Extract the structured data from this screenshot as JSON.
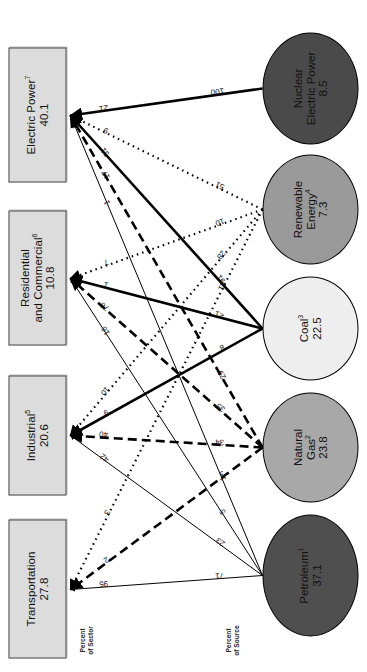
{
  "figure": {
    "units_note": "(Quadrillion Btu)",
    "source_axis_caption": "Percent\nof Source",
    "source_axis_caption_line1": "Percent",
    "source_axis_caption_line2": "of Source",
    "sector_axis_caption_line1": "Percent",
    "sector_axis_caption_line2": "of Sector"
  },
  "sources": [
    {
      "id": "petroleum",
      "name": "Petroleum",
      "footnote": "1",
      "value": "37.1",
      "fill": "#4f4f4f",
      "text_color": "#111111"
    },
    {
      "id": "natural-gas",
      "name": "Natural\nGas",
      "line1": "Natural",
      "line2": "Gas",
      "footnote": "2",
      "value": "23.8",
      "fill": "#a8a8a8",
      "text_color": "#111111"
    },
    {
      "id": "coal",
      "name": "Coal",
      "footnote": "3",
      "value": "22.5",
      "fill": "#eeeeee",
      "text_color": "#111111"
    },
    {
      "id": "renewable",
      "name": "Renewable\nEnergy",
      "line1": "Renewable",
      "line2": "Energy",
      "footnote": "4",
      "value": "7.3",
      "fill": "#9a9a9a",
      "text_color": "#111111"
    },
    {
      "id": "nuclear",
      "name": "Nuclear\nElectric Power",
      "line1": "Nuclear",
      "line2": "Electric Power",
      "footnote": "",
      "value": "8.5",
      "fill": "#4a4a4a",
      "text_color": "#111111"
    }
  ],
  "sectors": [
    {
      "id": "transportation",
      "name": "Transportation",
      "line1": "Transportation",
      "line2": "",
      "footnote": "",
      "value": "27.8"
    },
    {
      "id": "industrial",
      "name": "Industrial",
      "line1": "Industrial",
      "line2": "",
      "footnote": "5",
      "value": "20.6"
    },
    {
      "id": "residential",
      "name": "Residential and Commercial",
      "line1": "Residential",
      "line2": "and Commercial",
      "footnote": "6",
      "value": "10.8"
    },
    {
      "id": "electric-power",
      "name": "Electric Power",
      "line1": "Electric Power",
      "line2": "",
      "footnote": "7",
      "value": "40.1"
    }
  ],
  "chart_data": {
    "type": "diagram",
    "subtitle": "(Quadrillion Btu)",
    "source_totals": {
      "petroleum": 37.1,
      "natural-gas": 23.8,
      "coal": 22.5,
      "renewable": 7.3,
      "nuclear": 8.5
    },
    "sector_totals": {
      "transportation": 27.8,
      "industrial": 20.6,
      "residential": 10.8,
      "electric-power": 40.1
    },
    "flows": [
      {
        "source": "petroleum",
        "sector": "transportation",
        "percent_of_source": "71",
        "percent_of_sector": "95",
        "style": "solid-thin"
      },
      {
        "source": "petroleum",
        "sector": "industrial",
        "percent_of_source": "23",
        "percent_of_sector": "42",
        "style": "solid-thin"
      },
      {
        "source": "petroleum",
        "sector": "residential",
        "percent_of_source": "5",
        "percent_of_sector": "16",
        "style": "solid-thin"
      },
      {
        "source": "petroleum",
        "sector": "electric-power",
        "percent_of_source": "1",
        "percent_of_sector": "1",
        "style": "solid-thin"
      },
      {
        "source": "natural-gas",
        "sector": "transportation",
        "percent_of_source": "3",
        "percent_of_sector": "2",
        "style": "dashed"
      },
      {
        "source": "natural-gas",
        "sector": "industrial",
        "percent_of_source": "34",
        "percent_of_sector": "40",
        "style": "dashed"
      },
      {
        "source": "natural-gas",
        "sector": "residential",
        "percent_of_source": "35",
        "percent_of_sector": "76",
        "style": "dashed"
      },
      {
        "source": "natural-gas",
        "sector": "electric-power",
        "percent_of_source": "29",
        "percent_of_sector": "17",
        "style": "dashed"
      },
      {
        "source": "coal",
        "sector": "industrial",
        "percent_of_source": "8",
        "percent_of_sector": "9",
        "style": "solid-thick"
      },
      {
        "source": "coal",
        "sector": "residential",
        "percent_of_source": "<1",
        "percent_of_sector": "1",
        "style": "solid-thick"
      },
      {
        "source": "coal",
        "sector": "electric-power",
        "percent_of_source": "91",
        "percent_of_sector": "51",
        "style": "solid-thick"
      },
      {
        "source": "renewable",
        "sector": "transportation",
        "percent_of_source": "11",
        "percent_of_sector": "3",
        "style": "dotted"
      },
      {
        "source": "renewable",
        "sector": "industrial",
        "percent_of_source": "28",
        "percent_of_sector": "10",
        "style": "dotted"
      },
      {
        "source": "renewable",
        "sector": "residential",
        "percent_of_source": "10",
        "percent_of_sector": "7",
        "style": "dotted"
      },
      {
        "source": "renewable",
        "sector": "electric-power",
        "percent_of_source": "51",
        "percent_of_sector": "9",
        "style": "dotted"
      },
      {
        "source": "nuclear",
        "sector": "electric-power",
        "percent_of_source": "100",
        "percent_of_sector": "21",
        "style": "solid-thick"
      }
    ],
    "source_labels": {
      "petroleum": [
        "71",
        "23",
        "5",
        "1"
      ],
      "natural-gas": [
        "3",
        "34",
        "35",
        "29"
      ],
      "coal": [
        "8",
        "<1",
        "91"
      ],
      "renewable": [
        "11",
        "28",
        "10",
        "51"
      ],
      "nuclear": [
        "100"
      ]
    },
    "sector_labels": {
      "transportation": [
        "95",
        "2",
        "3"
      ],
      "industrial": [
        "42",
        "40",
        "9",
        "10"
      ],
      "residential": [
        "16",
        "76",
        "1",
        "7"
      ],
      "electric-power": [
        "1",
        "17",
        "51",
        "9",
        "21"
      ]
    }
  }
}
